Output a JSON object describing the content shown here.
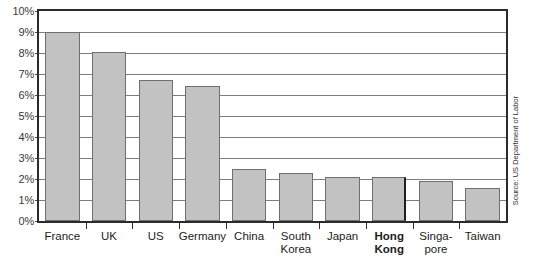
{
  "chart_data": {
    "type": "bar",
    "title": "",
    "xlabel": "",
    "ylabel": "",
    "ylim": [
      0,
      10
    ],
    "yunit": "%",
    "grid": true,
    "legend": "none",
    "categories": [
      "France",
      "UK",
      "US",
      "Germany",
      "China",
      "South Korea",
      "Japan",
      "Hong Kong",
      "Singapore",
      "Taiwan"
    ],
    "values": [
      9.0,
      8.05,
      6.7,
      6.45,
      2.5,
      2.3,
      2.1,
      2.1,
      1.9,
      1.55
    ],
    "highlight_category": "Hong Kong",
    "ytick_labels": [
      "10%",
      "9%",
      "8%",
      "7%",
      "6%",
      "5%",
      "4%",
      "3%",
      "2%",
      "1%",
      "0%"
    ],
    "ytick_values": [
      10,
      9,
      8,
      7,
      6,
      5,
      4,
      3,
      2,
      1,
      0
    ],
    "annotations": [
      "Source: US Department of Labor"
    ]
  },
  "axis": {
    "y_labels": [
      "10%",
      "9%",
      "8%",
      "7%",
      "6%",
      "5%",
      "4%",
      "3%",
      "2%",
      "1%",
      "0%"
    ],
    "x_labels": [
      {
        "lines": [
          "France"
        ],
        "bold": false
      },
      {
        "lines": [
          "UK"
        ],
        "bold": false
      },
      {
        "lines": [
          "US"
        ],
        "bold": false
      },
      {
        "lines": [
          "Germany"
        ],
        "bold": false
      },
      {
        "lines": [
          "China"
        ],
        "bold": false
      },
      {
        "lines": [
          "South",
          "Korea"
        ],
        "bold": false
      },
      {
        "lines": [
          "Japan"
        ],
        "bold": false
      },
      {
        "lines": [
          "Hong",
          "Kong"
        ],
        "bold": true
      },
      {
        "lines": [
          "Singa-",
          "pore"
        ],
        "bold": false
      },
      {
        "lines": [
          "Taiwan"
        ],
        "bold": false
      }
    ]
  },
  "source": {
    "text": "Source: US Department of Labor"
  },
  "colors": {
    "bar_fill": "#c2c2c2",
    "bar_border": "#6f6f6f",
    "highlight_border": "#1f1f1f",
    "frame": "#2b2b2b",
    "gridline": "#7e7e7e",
    "label_text": "#1c1c1c",
    "axis_text": "#3a3a3a"
  }
}
